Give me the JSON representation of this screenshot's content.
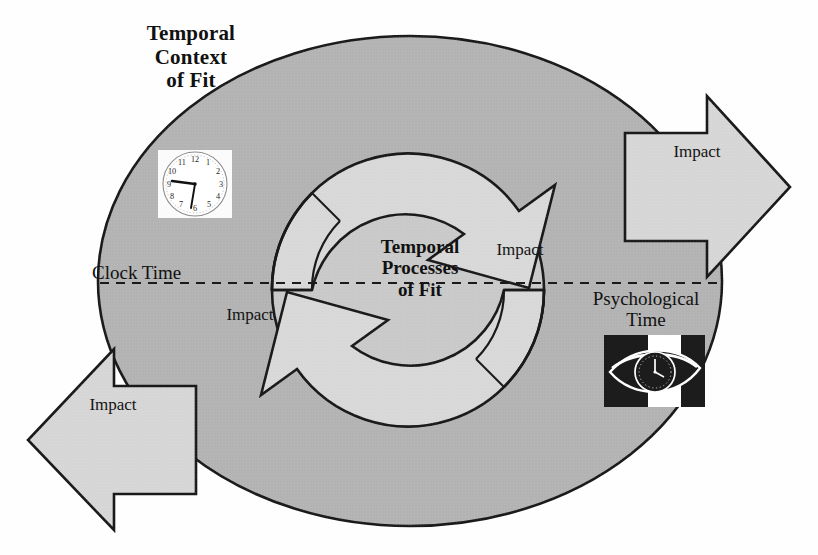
{
  "figure": {
    "type": "conceptual-diagram",
    "outer_label": "Temporal\nContext\nof Fit",
    "inner_label": "Temporal\nProcesses\nof Fit",
    "left_domain_label": "Clock Time",
    "right_domain_label": "Psychological\nTime",
    "impact_right_label": "Impact",
    "impact_left_label": "Impact",
    "impact_inner_right_label": "Impact",
    "impact_inner_left_label": "Impact",
    "divider": "dashed-horizontal-line",
    "icons": {
      "clock_face": "analog-wall-clock-icon",
      "eye_clock": "eye-with-clock-icon"
    }
  },
  "colors": {
    "outer_ellipse_fill": "#b3b3b3",
    "inner_circle_fill": "#c9c9c9",
    "arrow_body_fill": "#d4d4d4",
    "arrow_shadow_fill": "#9a9a9a",
    "stroke": "#1a1a1a",
    "text": "#111111",
    "background": "#fefefe",
    "icon_dark": "#1c1c1c",
    "icon_light": "#ffffff"
  },
  "geometry": {
    "outer_ellipse": {
      "cx": 410,
      "cy": 281,
      "rx": 312,
      "ry": 245
    },
    "inner_circle": {
      "cx": 408,
      "cy": 290,
      "r": 136
    },
    "dashed_line_y": 283,
    "dashed_line_x1": 100,
    "dashed_line_x2": 722
  }
}
